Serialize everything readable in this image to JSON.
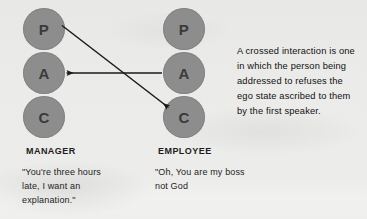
{
  "diagram": {
    "title_present": false,
    "columns": [
      {
        "role": "MANAGER",
        "ego_states": [
          {
            "code": "P",
            "name": "parent-ego-state"
          },
          {
            "code": "A",
            "name": "adult-ego-state"
          },
          {
            "code": "C",
            "name": "child-ego-state"
          }
        ],
        "quote": "\"You're three hours late, I want an explanation.\""
      },
      {
        "role": "EMPLOYEE",
        "ego_states": [
          {
            "code": "P",
            "name": "parent-ego-state"
          },
          {
            "code": "A",
            "name": "adult-ego-state"
          },
          {
            "code": "C",
            "name": "child-ego-state"
          }
        ],
        "quote": "\"Oh, You are my boss not God"
      }
    ],
    "transactions": [
      {
        "name": "stimulus-arrow",
        "from": "manager-parent",
        "to": "employee-child",
        "direction": "down-right"
      },
      {
        "name": "response-arrow",
        "from": "employee-adult",
        "to": "manager-adult",
        "direction": "left"
      }
    ],
    "description": "A crossed interaction is one in which the person being addressed to refuses the ego state ascribed to them by the first speaker.",
    "colors": {
      "circle_fill": "#8d8d8d",
      "circle_label": "#3a3a3a",
      "arrow": "#1a1a1a",
      "background": "#ebebe9",
      "text": "#1d1d1d"
    }
  }
}
